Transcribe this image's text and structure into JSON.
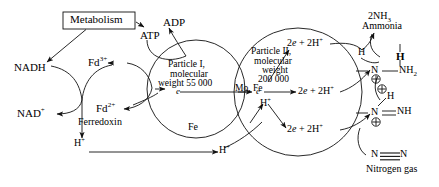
{
  "diagram": {
    "ink_color": "#111111",
    "background": "#ffffff",
    "metabolism_box": {
      "label": "Metabolism"
    },
    "energy": {
      "atp_label": "ATP",
      "adp_label": "ADP"
    },
    "electron_donor_cycle": {
      "nadh_label": "NADH",
      "nad_plus_label": "NAD",
      "nad_plus_charge": "+",
      "fd_oxidised_label": "Fd",
      "fd_oxidised_charge": "3+",
      "fd_reduced_label": "Fd",
      "fd_reduced_charge": "2+",
      "ferredoxin_caption": "Ferredoxin"
    },
    "particle_one": {
      "line1": "Particle I,",
      "line2": "molecular",
      "line3": "weight 55 000",
      "metal_label": "Fe",
      "electron_label": "e"
    },
    "particle_two": {
      "line1": "Particle II,",
      "line2": "molecular",
      "line3": "weight",
      "line4": "200 000",
      "metal_label": "Mo, Fe",
      "electron_label": "e"
    },
    "reduction_steps": {
      "step_upper": "2e + 2H",
      "step_middle": "2e + 2H",
      "step_lower": "2e + 2H",
      "charge": "+",
      "proton_label": "H",
      "proton_charge": "+"
    },
    "protons": {
      "bottom_left_label": "H",
      "bottom_left_charge": "+",
      "bottom_mid_label": "H",
      "bottom_mid_charge": "+",
      "internal_label": "H",
      "internal_charge": "+"
    },
    "products": {
      "ammonia_formula": "2NH",
      "ammonia_subscript": "3",
      "ammonia_name": "Ammonia"
    },
    "substrate": {
      "nitrogen_left": "N",
      "nitrogen_right": "N",
      "nitrogen_name": "Nitrogen gas"
    },
    "intermediate_hydrazido": {
      "h_label": "H",
      "n_label": "N",
      "nh2_label": "NH",
      "nh2_subscript": "2",
      "charge_symbol": "+"
    },
    "intermediate_diazene": {
      "h_label": "H",
      "n_label": "N",
      "nh_label": "NH",
      "charge_symbol": "+"
    }
  }
}
